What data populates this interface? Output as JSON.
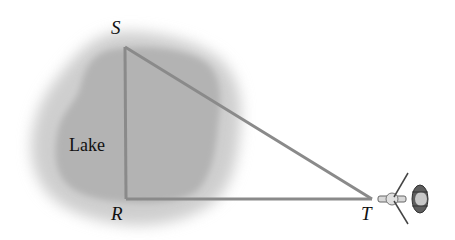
{
  "diagram": {
    "type": "geometry-word-problem",
    "labels": {
      "lake": "Lake",
      "vertex_s": "S",
      "vertex_r": "R",
      "vertex_t": "T"
    },
    "points": {
      "S": [
        125,
        47
      ],
      "R": [
        126,
        199
      ],
      "T": [
        372,
        199
      ]
    },
    "segments": [
      {
        "from": "S",
        "to": "R"
      },
      {
        "from": "R",
        "to": "T"
      },
      {
        "from": "S",
        "to": "T"
      }
    ],
    "colors": {
      "line": "#8a8a8a",
      "lake_inner": "#b4b4b4",
      "lake_outer": "#d2d2d2",
      "text": "#111111",
      "helicopter_body": "#6a6a6a"
    },
    "objects": [
      "helicopter-at-T"
    ]
  }
}
